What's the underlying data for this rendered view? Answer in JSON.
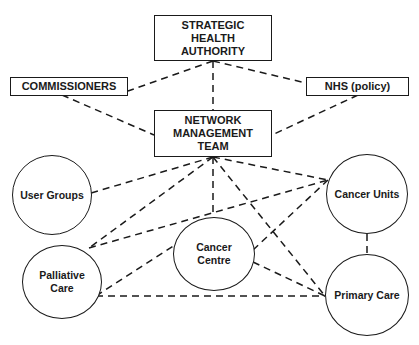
{
  "diagram": {
    "type": "organisational-network",
    "line_color": "#1a1a1a",
    "nodes": {
      "sha": {
        "label": "STRATEGIC\nHEALTH\nAUTHORITY",
        "shape": "rectangle"
      },
      "commissioners": {
        "label": "COMMISSIONERS",
        "shape": "rectangle"
      },
      "nhs": {
        "label": "NHS (policy)",
        "shape": "rectangle"
      },
      "nmt": {
        "label": "NETWORK\nMANAGEMENT\nTEAM",
        "shape": "rectangle"
      },
      "user_groups": {
        "label": "User Groups",
        "shape": "ellipse"
      },
      "palliative_care": {
        "label": "Palliative\nCare",
        "shape": "ellipse"
      },
      "cancer_centre": {
        "label": "Cancer\nCentre",
        "shape": "ellipse"
      },
      "cancer_units": {
        "label": "Cancer Units",
        "shape": "ellipse"
      },
      "primary_care": {
        "label": "Primary Care",
        "shape": "ellipse"
      }
    },
    "edges": [
      {
        "from": "sha",
        "to": "commissioners",
        "style": "dashed"
      },
      {
        "from": "sha",
        "to": "nhs",
        "style": "dashed"
      },
      {
        "from": "sha",
        "to": "nmt",
        "style": "dashed"
      },
      {
        "from": "commissioners",
        "to": "nmt",
        "style": "dashed"
      },
      {
        "from": "nhs",
        "to": "nmt",
        "style": "dashed"
      },
      {
        "from": "nmt",
        "to": "user_groups",
        "style": "dashed"
      },
      {
        "from": "nmt",
        "to": "palliative_care",
        "style": "dashed"
      },
      {
        "from": "nmt",
        "to": "cancer_centre",
        "style": "dashed"
      },
      {
        "from": "nmt",
        "to": "cancer_units",
        "style": "dashed"
      },
      {
        "from": "nmt",
        "to": "primary_care",
        "style": "dashed"
      },
      {
        "from": "palliative_care",
        "to": "cancer_units",
        "style": "dashed"
      },
      {
        "from": "palliative_care",
        "to": "primary_care",
        "style": "dashed"
      },
      {
        "from": "palliative_care",
        "to": "cancer_centre",
        "style": "dashed"
      },
      {
        "from": "cancer_centre",
        "to": "cancer_units",
        "style": "dashed"
      },
      {
        "from": "cancer_centre",
        "to": "primary_care",
        "style": "dashed"
      },
      {
        "from": "cancer_units",
        "to": "primary_care",
        "style": "dashed"
      }
    ]
  }
}
